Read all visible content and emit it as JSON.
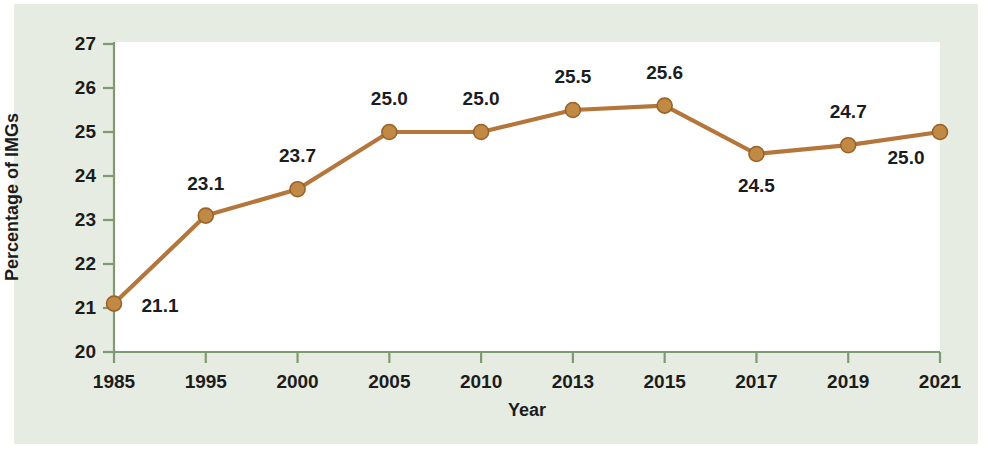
{
  "chart_data": {
    "type": "line",
    "title": "",
    "xlabel": "Year",
    "ylabel": "Percentage of IMGs",
    "categories": [
      "1985",
      "1995",
      "2000",
      "2005",
      "2010",
      "2013",
      "2015",
      "2017",
      "2019",
      "2021"
    ],
    "values": [
      21.1,
      23.1,
      23.7,
      25.0,
      25.0,
      25.5,
      25.6,
      24.5,
      24.7,
      25.0
    ],
    "point_labels": [
      "21.1",
      "23.1",
      "23.7",
      "25.0",
      "25.0",
      "25.5",
      "25.6",
      "24.5",
      "24.7",
      "25.0"
    ],
    "ylim": [
      20,
      27
    ],
    "yticks": [
      "20",
      "21",
      "22",
      "23",
      "24",
      "25",
      "26",
      "27"
    ],
    "xticks": [
      "1985",
      "1995",
      "2000",
      "2005",
      "2010",
      "2013",
      "2015",
      "2017",
      "2019",
      "2021"
    ],
    "grid": false,
    "legend": "none",
    "series": [
      {
        "name": "Percentage of IMGs",
        "values": [
          21.1,
          23.1,
          23.7,
          25.0,
          25.0,
          25.5,
          25.6,
          24.5,
          24.7,
          25.0
        ]
      }
    ],
    "colors": {
      "line": "#b4763a",
      "marker": "#c08a45",
      "marker_edge": "#9a6228",
      "axis": "#7f9a72",
      "panel_background": "#e6ece2",
      "plot_background": "#ffffff",
      "text": "#1c1c1c"
    },
    "label_offsets": [
      {
        "dx": 46,
        "dy": 2
      },
      {
        "dx": 0,
        "dy": -32
      },
      {
        "dx": 0,
        "dy": -33
      },
      {
        "dx": 0,
        "dy": -33
      },
      {
        "dx": 0,
        "dy": -33
      },
      {
        "dx": 0,
        "dy": -33
      },
      {
        "dx": 0,
        "dy": -33
      },
      {
        "dx": 0,
        "dy": 32
      },
      {
        "dx": 0,
        "dy": -33
      },
      {
        "dx": -34,
        "dy": 26
      }
    ]
  }
}
